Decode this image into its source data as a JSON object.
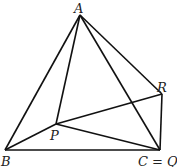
{
  "diagram": {
    "points": [
      {
        "id": "A",
        "label": "A"
      },
      {
        "id": "B",
        "label": "B"
      },
      {
        "id": "C",
        "label": "C = Q"
      },
      {
        "id": "R",
        "label": "R"
      },
      {
        "id": "P",
        "label": "P"
      }
    ],
    "edges": [
      [
        "A",
        "B"
      ],
      [
        "A",
        "P"
      ],
      [
        "A",
        "C"
      ],
      [
        "A",
        "R"
      ],
      [
        "R",
        "C"
      ],
      [
        "R",
        "P"
      ],
      [
        "P",
        "B"
      ],
      [
        "P",
        "C"
      ],
      [
        "B",
        "C"
      ]
    ]
  }
}
